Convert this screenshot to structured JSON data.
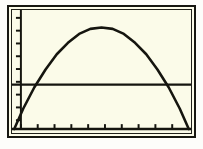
{
  "screen": {
    "device": "graphing-calculator",
    "background_color": "#fbfbe9",
    "ink_color": "#15150f",
    "frame_color": "#171711",
    "page_background": "#ffffff"
  },
  "chart_data": {
    "type": "line",
    "title": "",
    "subtitle": "",
    "xlabel": "",
    "ylabel": "",
    "grid": false,
    "legend": null,
    "axis_style": "calculator-tickmarks",
    "xlim": [
      -2,
      14
    ],
    "ylim": [
      -1,
      9
    ],
    "x_axis_position_y": 0,
    "y_axis_position_x": 0,
    "x_tick_spacing": 1.5,
    "y_tick_spacing": 1,
    "x_tick_count": 10,
    "y_tick_count": 9,
    "series": [
      {
        "name": "parabola",
        "kind": "quadratic",
        "expression": "y = -0.13(x - 6)^2 + 8",
        "vertex": [
          6.0,
          8.0
        ],
        "x_intercepts": [
          -1.8,
          13.8
        ],
        "x": [
          -1.8,
          -1.0,
          0.0,
          1.0,
          2.0,
          3.0,
          4.0,
          5.0,
          6.0,
          7.0,
          8.0,
          9.0,
          10.0,
          11.0,
          12.0,
          13.0,
          13.8
        ],
        "y": [
          0.0,
          1.6,
          3.3,
          4.7,
          5.9,
          6.8,
          7.5,
          7.9,
          8.0,
          7.9,
          7.5,
          6.8,
          5.9,
          4.7,
          3.3,
          1.6,
          0.0
        ]
      },
      {
        "name": "horizontal-line",
        "kind": "constant",
        "expression": "y = 3.5",
        "value": 3.5,
        "x": [
          -2,
          14
        ],
        "y": [
          3.5,
          3.5
        ]
      }
    ],
    "intersections": [
      {
        "x": 1.1,
        "y": 3.5
      },
      {
        "x": 10.9,
        "y": 3.5
      }
    ]
  },
  "annotations": {
    "curve_label": "",
    "line_label": ""
  }
}
